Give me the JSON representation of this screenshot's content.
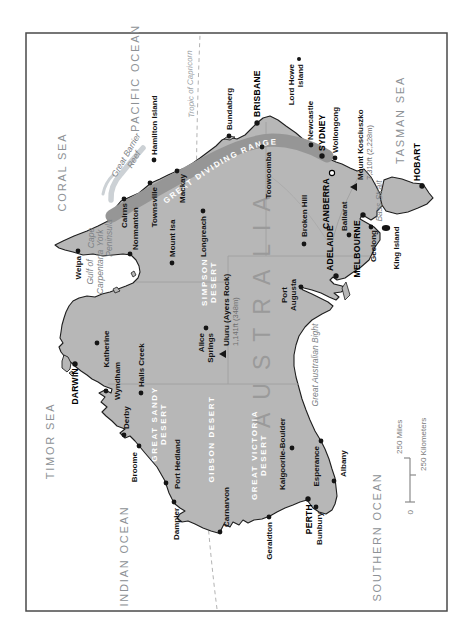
{
  "country_label": "AUSTRALIA",
  "range_label": "GREAT DIVIDING RANGE",
  "oceans": {
    "pacific": "PACIFIC OCEAN",
    "coral": "CORAL SEA",
    "tasman": "TASMAN SEA",
    "timor": "TIMOR SEA",
    "indian": "INDIAN OCEAN",
    "southern": "SOUTHERN OCEAN"
  },
  "water": {
    "gulf_line1": "Gulf of",
    "gulf_line2": "Carpentaria",
    "cape_line1": "Cape",
    "cape_line2": "York",
    "cape_line3": "Peninsula",
    "reef_line1": "Great Barrier",
    "reef_line2": "Reef",
    "bass_strait": "Bass Strait",
    "bight": "Great Australian Bight",
    "tropic": "Tropic of Capricorn"
  },
  "deserts": {
    "great_sandy_1": "GREAT SANDY",
    "great_sandy_2": "DESERT",
    "gibson": "GIBSON DESERT",
    "great_victoria_1": "GREAT VICTORIA",
    "great_victoria_2": "DESERT",
    "simpson_1": "SIMPSON",
    "simpson_2": "DESERT"
  },
  "capitals": {
    "darwin": "DARWIN",
    "brisbane": "BRISBANE",
    "sydney": "SYDNEY",
    "canberra": "CANBERRA",
    "melbourne": "MELBOURNE",
    "adelaide": "ADELAIDE",
    "perth": "PERTH",
    "hobart": "HOBART"
  },
  "cities": {
    "weipa": "Weipa",
    "normanton": "Normanton",
    "cairns": "Cairns",
    "townsville": "Townsville",
    "mackay": "Mackay",
    "mount_isa": "Mount Isa",
    "longreach": "Longreach",
    "bundaberg": "Bundaberg",
    "toowoomba": "Toowoomba",
    "newcastle": "Newcastle",
    "wollongong": "Wollongong",
    "broken_hill": "Broken Hill",
    "ballarat": "Ballarat",
    "geelong": "Geelong",
    "port_augusta_1": "Port",
    "port_augusta_2": "Augusta",
    "alice_1": "Alice",
    "alice_2": "Springs",
    "katherine": "Katherine",
    "wyndham": "Wyndham",
    "halls_creek": "Halls Creek",
    "derby": "Derby",
    "broome": "Broome",
    "port_hedland": "Port Hedland",
    "dampier": "Dampier",
    "carnarvon": "Carnarvon",
    "geraldton": "Geraldton",
    "bunbury": "Bunbury",
    "albany": "Albany",
    "esperance": "Esperance",
    "kalgoorlie": "Kalgoorlie-Boulder"
  },
  "islands": {
    "hamilton": "Hamilton Island",
    "lord_howe_1": "Lord Howe",
    "lord_howe_2": "Island",
    "king": "King Island"
  },
  "peaks": {
    "kosciuszko_name": "Mount Kosciuszko",
    "kosciuszko_elev": "7,310ft (2,228m)",
    "uluru_name": "Uluru (Ayers Rock)",
    "uluru_elev": "1,141ft (348m)"
  },
  "scale": {
    "zero": "0",
    "miles": "250 Miles",
    "kilometers": "250 Kilometers"
  },
  "colors": {
    "land": "#b7b7b7",
    "coastline": "#1e1e1e",
    "range_band": "#969696",
    "reef": "#ccd1d5",
    "desert_text": "#ffffff",
    "ocean_text": "#8d9195",
    "frame": "#4a4a4a"
  }
}
